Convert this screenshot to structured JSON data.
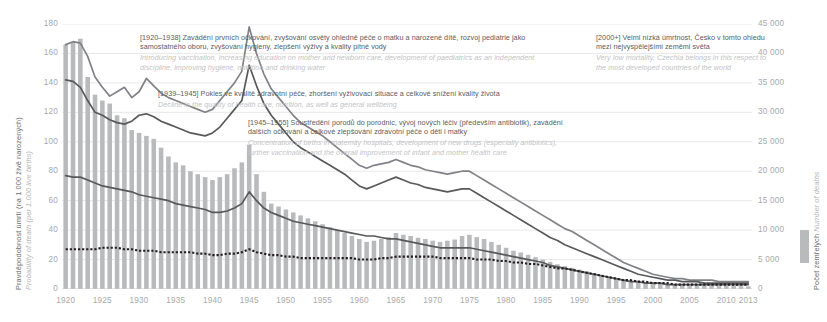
{
  "axes": {
    "y_left": {
      "title_cz": "Pravděpodobnost úmrtí (na 1 000 živě narozených)",
      "title_en": "Probability of death (per 1,000 live births)",
      "ticks": [
        "0",
        "20",
        "40",
        "60",
        "80",
        "100",
        "120",
        "140",
        "160",
        "180"
      ]
    },
    "y_right": {
      "title_cz": "Počet zemřelých",
      "title_en": "Number of deaths",
      "ticks": [
        "0",
        "5 000",
        "10 000",
        "15 000",
        "20 000",
        "25 000",
        "30 000",
        "35 000",
        "40 000",
        "45 000"
      ]
    },
    "x": {
      "ticks": [
        "1920",
        "1925",
        "1930",
        "1935",
        "1940",
        "1945",
        "1950",
        "1955",
        "1960",
        "1965",
        "1970",
        "1975",
        "1980",
        "1985",
        "1990",
        "1995",
        "2000",
        "2005",
        "2010",
        "2013"
      ]
    }
  },
  "annotations": [
    {
      "range": "[1920–1938]",
      "cz": "Zavádění prvních očkování, zvyšování osvěty ohledně péče o matku a narozené dítě, rozvoj pediatrie jako samostatného oboru, zvyšování hygieny, zlepšení výživy a kvality pitné vody",
      "en": "Introducing vaccination, increasing education on mother and newborn care, development of paediatrics as an independent discipline, improving hygiene, nutrition and drinking water"
    },
    {
      "range": "[1939–1945]",
      "cz": "Pokles ve kvalitě zdravotní péče, zhoršení vyživovací situace a celkové snížení kvality života",
      "en": "Decline in the quality of health care, nutrition, as well as general wellbeing"
    },
    {
      "range": "[1945–1955]",
      "cz": "Soustředění porodů do porodnic, vývoj nových léčiv (především antibiotik), zavádění dalších očkování a celkové zlepšování zdravotní péče o děti i matky",
      "en": "Concentration of births in maternity hospitals, development of new drugs (especially antibiotics), further vaccination and the overall improvement of infant and mother health care"
    },
    {
      "range": "[2000+]",
      "cz": "Velmi nízká úmrtnost, Česko v tomto ohledu mezi nejvyspělejšími zeměmi světa",
      "en": "Very low mortality, Czechia belongs in this respect to the most developed countries of the world"
    }
  ],
  "colors": {
    "bars": "#b9babc",
    "line_upper": "#808285",
    "line_middle": "#58595b",
    "line_dotted": "#231f20",
    "grid": "#e8e8e9",
    "text": "#58585a",
    "text_muted": "#a7a9ac",
    "text_italic": "#c2c3c5"
  },
  "chart_data": {
    "type": "line",
    "title": "",
    "xlabel": "",
    "ylabel": "Pravděpodobnost úmrtí (na 1 000 živě narozených)",
    "ylabel_right": "Počet zemřelých",
    "xlim": [
      1920,
      2013
    ],
    "ylim": [
      0,
      180
    ],
    "ylim_right": [
      0,
      45000
    ],
    "grid": true,
    "legend_position": "right",
    "x": [
      1920,
      1921,
      1922,
      1923,
      1924,
      1925,
      1926,
      1927,
      1928,
      1929,
      1930,
      1931,
      1932,
      1933,
      1934,
      1935,
      1936,
      1937,
      1938,
      1939,
      1940,
      1941,
      1942,
      1943,
      1944,
      1945,
      1946,
      1947,
      1948,
      1949,
      1950,
      1951,
      1952,
      1953,
      1954,
      1955,
      1956,
      1957,
      1958,
      1959,
      1960,
      1961,
      1962,
      1963,
      1964,
      1965,
      1966,
      1967,
      1968,
      1969,
      1970,
      1971,
      1972,
      1973,
      1974,
      1975,
      1976,
      1977,
      1978,
      1979,
      1980,
      1981,
      1982,
      1983,
      1984,
      1985,
      1986,
      1987,
      1988,
      1989,
      1990,
      1991,
      1992,
      1993,
      1994,
      1995,
      1996,
      1997,
      1998,
      1999,
      2000,
      2001,
      2002,
      2003,
      2004,
      2005,
      2006,
      2007,
      2008,
      2009,
      2010,
      2011,
      2012,
      2013
    ],
    "series": [
      {
        "name": "Počet zemřelých (bars, right axis)",
        "type": "bar",
        "axis": "right",
        "color": "#b9babc",
        "values": [
          41500,
          42000,
          42500,
          36000,
          33000,
          32000,
          31500,
          29500,
          29000,
          27000,
          26500,
          26000,
          25500,
          24000,
          22500,
          21500,
          21000,
          20000,
          19500,
          19000,
          18500,
          19000,
          19500,
          20500,
          21500,
          24500,
          19500,
          16500,
          14500,
          14000,
          13500,
          13000,
          12500,
          12000,
          11500,
          11000,
          10500,
          10000,
          9500,
          9000,
          8500,
          8000,
          8200,
          8500,
          8800,
          9500,
          9200,
          9000,
          8700,
          8500,
          8200,
          8000,
          8200,
          8400,
          9000,
          9200,
          8800,
          8500,
          8000,
          7500,
          7000,
          6500,
          6200,
          5800,
          5400,
          5000,
          4600,
          4200,
          3900,
          3600,
          3300,
          3000,
          2700,
          2400,
          2100,
          1800,
          1600,
          1400,
          1200,
          1050,
          900,
          800,
          750,
          700,
          650,
          620,
          600,
          580,
          560,
          540,
          520,
          500,
          480,
          450
        ]
      },
      {
        "name": "Horní křivka (upper line)",
        "type": "line",
        "axis": "left",
        "color": "#808285",
        "values": [
          166,
          168,
          167,
          158,
          144,
          137,
          131,
          134,
          137,
          130,
          134,
          143,
          138,
          133,
          130,
          128,
          126,
          124,
          122,
          120,
          122,
          128,
          134,
          140,
          148,
          178,
          160,
          146,
          136,
          130,
          124,
          118,
          113,
          110,
          107,
          104,
          100,
          96,
          92,
          88,
          84,
          82,
          84,
          85,
          86,
          88,
          86,
          84,
          83,
          81,
          80,
          79,
          78,
          79,
          80,
          80,
          77,
          74,
          71,
          68,
          65,
          62,
          59,
          56,
          53,
          50,
          47,
          44,
          41,
          39,
          36,
          33,
          30,
          27,
          24,
          21,
          18,
          16,
          14,
          12,
          10,
          9,
          8,
          7,
          7,
          6,
          6,
          6,
          6,
          5,
          5,
          5,
          5,
          5
        ]
      },
      {
        "name": "Prostřední křivka (middle line)",
        "type": "line",
        "axis": "left",
        "color": "#58595b",
        "values": [
          142,
          141,
          137,
          128,
          120,
          118,
          115,
          113,
          112,
          114,
          118,
          119,
          117,
          114,
          112,
          110,
          108,
          106,
          105,
          104,
          106,
          110,
          116,
          122,
          128,
          152,
          138,
          126,
          118,
          112,
          106,
          100,
          96,
          93,
          90,
          87,
          84,
          81,
          78,
          74,
          70,
          68,
          70,
          72,
          74,
          76,
          74,
          72,
          71,
          69,
          68,
          67,
          66,
          67,
          68,
          68,
          65,
          62,
          59,
          56,
          53,
          50,
          47,
          44,
          41,
          38,
          35,
          33,
          30,
          28,
          26,
          24,
          22,
          20,
          18,
          16,
          14,
          12,
          10,
          9,
          8,
          7,
          6,
          6,
          5,
          5,
          5,
          4,
          4,
          4,
          4,
          4,
          4,
          4
        ]
      },
      {
        "name": "Spodní křivka (lower line)",
        "type": "line",
        "axis": "left",
        "color": "#58595b",
        "values": [
          77,
          76,
          76,
          74,
          72,
          70,
          69,
          68,
          67,
          66,
          64,
          63,
          62,
          61,
          60,
          58,
          57,
          56,
          55,
          54,
          52,
          52,
          53,
          55,
          58,
          66,
          60,
          55,
          52,
          50,
          48,
          46,
          45,
          44,
          43,
          42,
          41,
          40,
          39,
          38,
          37,
          36,
          36,
          35,
          34,
          34,
          33,
          32,
          31,
          30,
          29,
          28,
          28,
          28,
          28,
          28,
          27,
          26,
          25,
          24,
          23,
          22,
          21,
          20,
          19,
          18,
          16,
          15,
          14,
          13,
          12,
          11,
          10,
          9,
          8,
          7,
          6,
          5,
          5,
          4,
          4,
          4,
          3,
          3,
          3,
          3,
          3,
          3,
          3,
          3,
          3,
          3,
          3,
          3
        ]
      },
      {
        "name": "Tečkovaná křivka (dotted line)",
        "type": "line",
        "axis": "left",
        "color": "#231f20",
        "values": [
          27,
          27,
          27,
          27,
          27,
          28,
          28,
          28,
          27,
          27,
          26,
          26,
          26,
          25,
          25,
          25,
          25,
          25,
          24,
          24,
          23,
          23,
          24,
          24,
          25,
          27,
          25,
          24,
          23,
          23,
          22,
          22,
          21,
          21,
          21,
          21,
          21,
          21,
          21,
          21,
          20,
          20,
          20,
          21,
          21,
          22,
          22,
          22,
          22,
          22,
          22,
          21,
          21,
          21,
          21,
          21,
          20,
          20,
          20,
          19,
          19,
          18,
          18,
          17,
          17,
          16,
          15,
          14,
          14,
          13,
          12,
          11,
          10,
          9,
          8,
          7,
          6,
          6,
          5,
          5,
          4,
          4,
          4,
          3,
          3,
          3,
          3,
          3,
          3,
          3,
          3,
          3,
          3,
          3
        ]
      }
    ]
  }
}
